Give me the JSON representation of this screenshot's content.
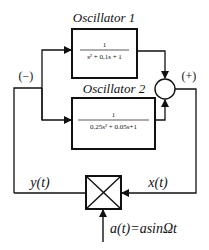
{
  "diagram": {
    "type": "block-diagram",
    "colors": {
      "stroke": "#111111",
      "background": "#ffffff"
    },
    "blocks": [
      {
        "id": "oscillator-1",
        "title": "Oscillator 1",
        "numerator": "1",
        "denominator": "s² + 0,1s + 1"
      },
      {
        "id": "oscillator-2",
        "title": "Oscillator 2",
        "numerator": "1",
        "denominator": "0.25s² + 0.05s+1"
      }
    ],
    "summing_junction": {
      "sign": "(+)"
    },
    "feedback_sign": "(−)",
    "multiplier": {
      "symbol": "⊠"
    },
    "signals": {
      "output": "y(t)",
      "input": "x(t)",
      "modulation": "a(t)=asinΩt"
    }
  }
}
